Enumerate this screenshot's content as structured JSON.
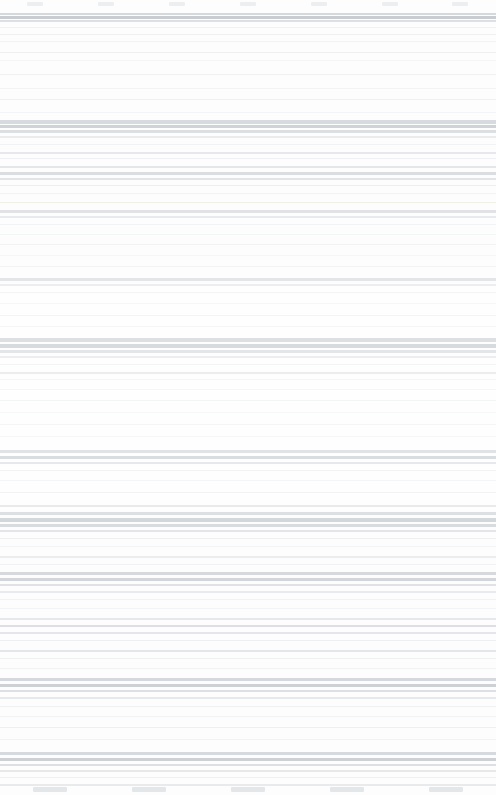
{
  "capture": {
    "width": 496,
    "height": 795,
    "background_color": "#ffffff",
    "surface_color": "#fdfdfd",
    "legible_text": "",
    "condition": "degraded-horizontal-banding"
  },
  "status_strip": {
    "blob_color": "#eceef0",
    "blobs": [
      "",
      "",
      "",
      "",
      "",
      "",
      ""
    ]
  },
  "tab_strip": {
    "blob_color": "#e4e7ea",
    "blobs": [
      "",
      "",
      "",
      "",
      ""
    ]
  },
  "bands": [
    {
      "top": 13,
      "height": 2,
      "color": "#d6d9dc"
    },
    {
      "top": 16,
      "height": 3,
      "color": "#c8ccd0"
    },
    {
      "top": 20,
      "height": 2,
      "color": "#dcdfe2"
    },
    {
      "top": 27,
      "height": 1,
      "color": "#f0f1f2"
    },
    {
      "top": 34,
      "height": 1,
      "color": "#eef0f1"
    },
    {
      "top": 41,
      "height": 1,
      "color": "#f2f3f4"
    },
    {
      "top": 52,
      "height": 1,
      "color": "#eceef0"
    },
    {
      "top": 60,
      "height": 1,
      "color": "#f3f4f5"
    },
    {
      "top": 74,
      "height": 1,
      "color": "#eff0f1"
    },
    {
      "top": 88,
      "height": 1,
      "color": "#f1f2f3"
    },
    {
      "top": 99,
      "height": 1,
      "color": "#edeff0"
    },
    {
      "top": 112,
      "height": 1,
      "color": "#f2f3f4"
    },
    {
      "top": 120,
      "height": 4,
      "color": "#d2d6da"
    },
    {
      "top": 125,
      "height": 3,
      "color": "#c9cdd1"
    },
    {
      "top": 130,
      "height": 3,
      "color": "#d8dbde"
    },
    {
      "top": 136,
      "height": 2,
      "color": "#e6e8ea"
    },
    {
      "top": 144,
      "height": 1,
      "color": "#eef0f1"
    },
    {
      "top": 152,
      "height": 2,
      "color": "#e2e5e8"
    },
    {
      "top": 158,
      "height": 1,
      "color": "#edeef0"
    },
    {
      "top": 166,
      "height": 2,
      "color": "#dfe2e5"
    },
    {
      "top": 172,
      "height": 3,
      "color": "#d4d8dc"
    },
    {
      "top": 178,
      "height": 2,
      "color": "#dde0e3"
    },
    {
      "top": 185,
      "height": 1,
      "color": "#e9ebed"
    },
    {
      "top": 193,
      "height": 1,
      "color": "#f0f1f2"
    },
    {
      "top": 202,
      "height": 1,
      "color": "#eceee0"
    },
    {
      "top": 210,
      "height": 3,
      "color": "#d9dce0"
    },
    {
      "top": 216,
      "height": 2,
      "color": "#e3e6e9"
    },
    {
      "top": 224,
      "height": 1,
      "color": "#eff0f1"
    },
    {
      "top": 234,
      "height": 1,
      "color": "#f1f2f3"
    },
    {
      "top": 244,
      "height": 1,
      "color": "#edeef0"
    },
    {
      "top": 255,
      "height": 1,
      "color": "#f2f3f4"
    },
    {
      "top": 266,
      "height": 1,
      "color": "#eef0f1"
    },
    {
      "top": 278,
      "height": 3,
      "color": "#dadde0"
    },
    {
      "top": 284,
      "height": 2,
      "color": "#e5e7ea"
    },
    {
      "top": 292,
      "height": 1,
      "color": "#eff0f2"
    },
    {
      "top": 303,
      "height": 1,
      "color": "#f2f3f4"
    },
    {
      "top": 315,
      "height": 1,
      "color": "#edeef0"
    },
    {
      "top": 326,
      "height": 1,
      "color": "#f0f1f2"
    },
    {
      "top": 338,
      "height": 4,
      "color": "#cfd3d7"
    },
    {
      "top": 344,
      "height": 4,
      "color": "#c7cbcf"
    },
    {
      "top": 350,
      "height": 3,
      "color": "#d6d9dd"
    },
    {
      "top": 356,
      "height": 2,
      "color": "#e2e5e8"
    },
    {
      "top": 364,
      "height": 1,
      "color": "#ebedef"
    },
    {
      "top": 372,
      "height": 2,
      "color": "#e0e3e6"
    },
    {
      "top": 379,
      "height": 1,
      "color": "#eef0f1"
    },
    {
      "top": 389,
      "height": 1,
      "color": "#f1f2f3"
    },
    {
      "top": 400,
      "height": 1,
      "color": "#edeff0"
    },
    {
      "top": 412,
      "height": 1,
      "color": "#f2f3f4"
    },
    {
      "top": 424,
      "height": 1,
      "color": "#eff0f1"
    },
    {
      "top": 436,
      "height": 1,
      "color": "#f1f2f3"
    },
    {
      "top": 450,
      "height": 3,
      "color": "#d3d7db"
    },
    {
      "top": 456,
      "height": 3,
      "color": "#cbcfd3"
    },
    {
      "top": 462,
      "height": 2,
      "color": "#dcdfe2"
    },
    {
      "top": 470,
      "height": 1,
      "color": "#ebedef"
    },
    {
      "top": 480,
      "height": 1,
      "color": "#f0f1f2"
    },
    {
      "top": 492,
      "height": 1,
      "color": "#edeef0"
    },
    {
      "top": 505,
      "height": 2,
      "color": "#e0e3e6"
    },
    {
      "top": 512,
      "height": 3,
      "color": "#d2d6da"
    },
    {
      "top": 518,
      "height": 4,
      "color": "#c6cacf"
    },
    {
      "top": 524,
      "height": 3,
      "color": "#cdd1d5"
    },
    {
      "top": 530,
      "height": 2,
      "color": "#dadde1"
    },
    {
      "top": 538,
      "height": 1,
      "color": "#e9ebed"
    },
    {
      "top": 546,
      "height": 1,
      "color": "#f0f1f2"
    },
    {
      "top": 556,
      "height": 2,
      "color": "#e4e7ea"
    },
    {
      "top": 564,
      "height": 1,
      "color": "#edeef0"
    },
    {
      "top": 572,
      "height": 3,
      "color": "#cdd1d5"
    },
    {
      "top": 578,
      "height": 3,
      "color": "#c9cdd1"
    },
    {
      "top": 584,
      "height": 2,
      "color": "#d9dce0"
    },
    {
      "top": 591,
      "height": 2,
      "color": "#e3e6e9"
    },
    {
      "top": 599,
      "height": 1,
      "color": "#eef0f1"
    },
    {
      "top": 608,
      "height": 1,
      "color": "#f1f2f3"
    },
    {
      "top": 618,
      "height": 2,
      "color": "#e1e4e7"
    },
    {
      "top": 625,
      "height": 2,
      "color": "#d7dade"
    },
    {
      "top": 632,
      "height": 2,
      "color": "#dfe2e5"
    },
    {
      "top": 640,
      "height": 1,
      "color": "#ebedef"
    },
    {
      "top": 650,
      "height": 2,
      "color": "#e0e3e6"
    },
    {
      "top": 658,
      "height": 1,
      "color": "#edeef0"
    },
    {
      "top": 668,
      "height": 1,
      "color": "#f0f1f2"
    },
    {
      "top": 678,
      "height": 3,
      "color": "#d0d4d8"
    },
    {
      "top": 684,
      "height": 3,
      "color": "#c8ccd0"
    },
    {
      "top": 690,
      "height": 2,
      "color": "#d9dce0"
    },
    {
      "top": 697,
      "height": 2,
      "color": "#e4e7ea"
    },
    {
      "top": 706,
      "height": 1,
      "color": "#eff0f1"
    },
    {
      "top": 716,
      "height": 1,
      "color": "#f1f2f3"
    },
    {
      "top": 727,
      "height": 1,
      "color": "#edeef0"
    },
    {
      "top": 739,
      "height": 1,
      "color": "#f0f1f2"
    },
    {
      "top": 752,
      "height": 3,
      "color": "#d4d8dc"
    },
    {
      "top": 758,
      "height": 3,
      "color": "#cbcfd3"
    },
    {
      "top": 764,
      "height": 2,
      "color": "#dcdfe2"
    },
    {
      "top": 770,
      "height": 2,
      "color": "#e5e8ea"
    },
    {
      "top": 777,
      "height": 1,
      "color": "#eef0f1"
    },
    {
      "top": 784,
      "height": 2,
      "color": "#e8eaec"
    }
  ]
}
